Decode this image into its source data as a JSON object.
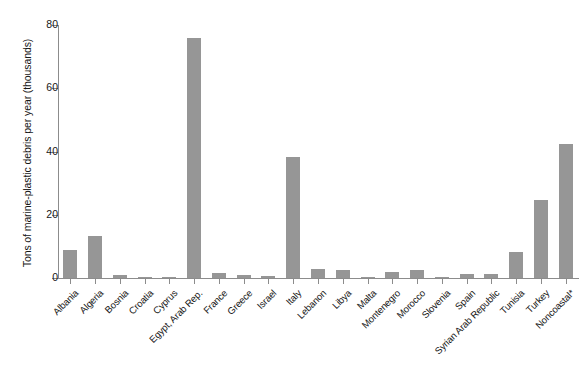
{
  "chart_data": {
    "type": "bar",
    "title": "",
    "xlabel": "",
    "ylabel": "Tons of marine-plastic debris per year (thousands)",
    "ylim": [
      0,
      80
    ],
    "yticks": [
      0,
      20,
      40,
      60,
      80
    ],
    "ytick_labels": [
      "0",
      "20",
      "40",
      "60",
      "80"
    ],
    "grid": false,
    "legend": "none",
    "bar_color": "#969696",
    "axis_color": "#8c8c8c",
    "categories": [
      "Albania",
      "Algeria",
      "Bosnia",
      "Croatia",
      "Cyprus",
      "Egypt, Arab Rep.",
      "France",
      "Greece",
      "Israel",
      "Italy",
      "Lebanon",
      "Libya",
      "Malta",
      "Montenegro",
      "Morocco",
      "Slovenia",
      "Spain",
      "Syrian Arab Republic",
      "Tunisia",
      "Turkey",
      "Noncoastal*"
    ],
    "values": [
      8.8,
      13.2,
      1.0,
      0.3,
      0.2,
      76.0,
      1.6,
      0.8,
      0.7,
      38.2,
      3.0,
      2.6,
      0.2,
      1.9,
      2.4,
      0.2,
      1.2,
      1.4,
      8.3,
      24.6,
      42.3
    ]
  }
}
